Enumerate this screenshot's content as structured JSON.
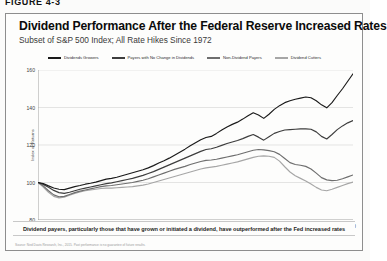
{
  "figure_label": "FIGURE 4-3",
  "card": {
    "title": "Dividend Performance After the Federal Reserve Increased Rates",
    "subtitle": "Subset of S&P 500 Index; All Rate Hikes Since 1972",
    "caption": "Dividend payers, particularly those that have grown or initiated a dividend, have outperformed after the Fed increased rates",
    "source": "Source: Ned Davis Research, Inc., 2015. Past performance is no guarantee of future results."
  },
  "chart_data": {
    "type": "line",
    "title": "Dividend Performance After the Federal Reserve Increased Rates",
    "subtitle": "Subset of S&P 500 Index; All Rate Hikes Since 1972",
    "xlabel": "Elapsed Months",
    "ylabel": "Index of Returns",
    "xlim": [
      0,
      60
    ],
    "ylim": [
      80,
      160
    ],
    "xticks": [
      0,
      5,
      10,
      15,
      20,
      25,
      30,
      35,
      40,
      45,
      50,
      55,
      60
    ],
    "yticks": [
      80,
      100,
      120,
      140,
      160
    ],
    "grid": "horizontal",
    "legend_position": "top",
    "x": [
      0,
      1,
      2,
      3,
      4,
      5,
      6,
      7,
      8,
      9,
      10,
      11,
      12,
      13,
      14,
      15,
      16,
      17,
      18,
      19,
      20,
      21,
      22,
      23,
      24,
      25,
      26,
      27,
      28,
      29,
      30,
      31,
      32,
      33,
      34,
      35,
      36,
      37,
      38,
      39,
      40,
      41,
      42,
      43,
      44,
      45,
      46,
      47,
      48,
      49,
      50,
      51,
      52,
      53,
      54,
      55,
      56,
      57,
      58,
      59,
      60
    ],
    "series": [
      {
        "name": "Dividends Growers",
        "color": "#1a1a1a",
        "values": [
          100,
          99.4,
          98.2,
          97.1,
          96.4,
          96.2,
          97.0,
          97.8,
          98.4,
          99.1,
          99.6,
          100.2,
          101.0,
          101.8,
          102.2,
          102.8,
          103.6,
          104.4,
          105.2,
          106.0,
          106.8,
          107.8,
          109.0,
          110.4,
          111.6,
          113.0,
          114.6,
          116.2,
          117.8,
          119.6,
          121.2,
          122.8,
          124.0,
          124.6,
          126.2,
          128.0,
          129.6,
          131.0,
          132.2,
          133.8,
          135.6,
          137.2,
          136.0,
          134.2,
          136.4,
          139.0,
          141.0,
          142.6,
          143.6,
          144.4,
          145.0,
          145.6,
          145.2,
          143.6,
          141.4,
          139.8,
          142.6,
          146.4,
          150.0,
          154.0,
          158.0
        ]
      },
      {
        "name": "Payers with No Change in Dividends",
        "color": "#3d3d3d",
        "values": [
          100,
          99.0,
          97.4,
          95.8,
          94.6,
          94.2,
          94.8,
          95.6,
          96.4,
          97.0,
          97.6,
          98.2,
          98.8,
          99.4,
          99.8,
          100.4,
          101.0,
          101.6,
          102.2,
          103.0,
          103.8,
          104.8,
          105.8,
          107.0,
          108.2,
          109.4,
          110.6,
          111.8,
          113.0,
          114.2,
          115.4,
          116.6,
          117.6,
          118.0,
          118.8,
          119.8,
          120.8,
          121.6,
          122.4,
          123.4,
          124.6,
          125.6,
          124.2,
          122.6,
          124.4,
          126.2,
          127.2,
          128.0,
          128.2,
          128.4,
          128.6,
          128.6,
          128.4,
          127.0,
          124.6,
          123.2,
          125.6,
          128.2,
          130.2,
          131.8,
          133.0
        ]
      },
      {
        "name": "Non-Dividend Payers",
        "color": "#6e6e6e",
        "values": [
          100,
          98.2,
          95.6,
          93.4,
          92.4,
          92.6,
          93.6,
          94.6,
          95.4,
          96.0,
          96.6,
          97.2,
          97.8,
          98.2,
          98.4,
          98.8,
          99.2,
          99.6,
          100.0,
          100.6,
          101.2,
          102.0,
          103.0,
          104.0,
          105.0,
          106.0,
          107.0,
          107.8,
          108.6,
          109.6,
          110.4,
          111.2,
          111.8,
          112.0,
          112.4,
          113.0,
          113.6,
          114.2,
          114.8,
          115.6,
          116.4,
          117.2,
          117.6,
          117.4,
          117.0,
          116.4,
          115.0,
          112.8,
          110.6,
          109.6,
          109.2,
          108.6,
          107.2,
          105.0,
          102.6,
          101.4,
          101.0,
          101.2,
          102.0,
          103.0,
          104.0
        ]
      },
      {
        "name": "Dividend Cutters",
        "color": "#a6a6a6",
        "values": [
          100,
          97.6,
          94.8,
          92.6,
          91.8,
          92.2,
          93.2,
          94.2,
          95.0,
          95.6,
          96.0,
          96.4,
          96.8,
          97.0,
          97.0,
          97.2,
          97.4,
          97.6,
          97.8,
          98.2,
          98.6,
          99.2,
          100.0,
          100.8,
          101.6,
          102.4,
          103.2,
          104.0,
          104.8,
          105.6,
          106.4,
          107.2,
          107.8,
          108.2,
          108.6,
          109.2,
          109.8,
          110.4,
          111.0,
          111.8,
          112.6,
          113.4,
          114.0,
          114.2,
          114.0,
          113.4,
          111.4,
          108.4,
          105.6,
          103.6,
          102.2,
          100.8,
          99.2,
          97.4,
          96.0,
          95.6,
          96.4,
          97.4,
          98.4,
          99.4,
          100.2
        ]
      }
    ]
  }
}
